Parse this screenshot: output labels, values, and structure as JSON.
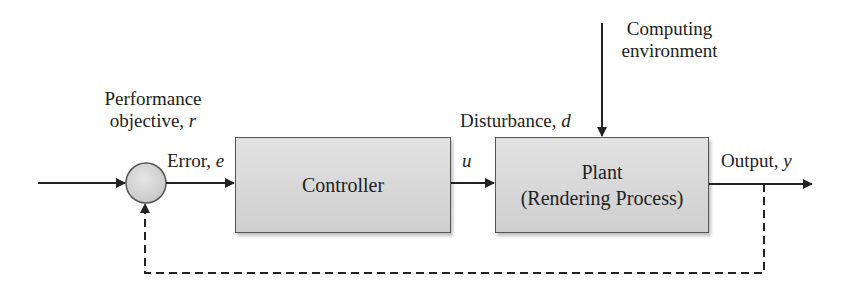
{
  "diagram": {
    "type": "feedback-control-loop",
    "nodes": {
      "summing_junction": {
        "label": ""
      },
      "controller": {
        "label": "Controller"
      },
      "plant": {
        "line1": "Plant",
        "line2": "(Rendering Process)"
      }
    },
    "labels": {
      "reference_line1": "Performance",
      "reference_line2_text": "objective, ",
      "reference_symbol": "r",
      "error_text": "Error, ",
      "error_symbol": "e",
      "control_symbol": "u",
      "disturbance_text": "Disturbance, ",
      "disturbance_symbol": "d",
      "environment_line1": "Computing",
      "environment_line2": "environment",
      "output_text": "Output, ",
      "output_symbol": "y"
    },
    "edges": [
      {
        "from": "input",
        "to": "summing_junction",
        "style": "solid"
      },
      {
        "from": "summing_junction",
        "to": "controller",
        "label": "Error, e",
        "style": "solid"
      },
      {
        "from": "controller",
        "to": "plant",
        "label": "u",
        "style": "solid"
      },
      {
        "from": "computing_environment",
        "to": "plant",
        "label": "Disturbance, d",
        "style": "solid"
      },
      {
        "from": "plant",
        "to": "output",
        "label": "Output, y",
        "style": "solid"
      },
      {
        "from": "output",
        "to": "summing_junction",
        "label": "feedback",
        "style": "dashed"
      }
    ],
    "colors": {
      "box_fill": "#d8d8d8",
      "line": "#222222",
      "circle_fill": "#d6d6d6"
    }
  }
}
